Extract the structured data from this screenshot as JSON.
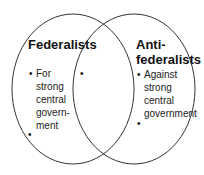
{
  "diagram": {
    "type": "venn",
    "left": {
      "title": "Federalists",
      "items": [
        "For strong central govern-ment",
        ""
      ],
      "item_lines": [
        "For",
        "strong",
        "central",
        "govern-",
        "ment"
      ]
    },
    "right": {
      "title_line1": "Anti-",
      "title_line2": "federalists",
      "items": [
        "Against strong central government",
        ""
      ],
      "item_lines": [
        "Against",
        "strong",
        "central",
        "government"
      ]
    },
    "overlap": {
      "items": [
        ""
      ]
    },
    "bullet_glyph": "•",
    "stroke_color": "#333333"
  }
}
